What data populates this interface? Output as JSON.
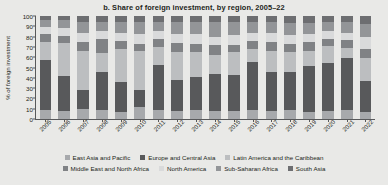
{
  "chart_data": {
    "type": "bar",
    "stacked": true,
    "stacked_mode": "percent",
    "title": "b. Share of foreign investment, by region, 2005–22",
    "xlabel": "",
    "ylabel": "% of foreign investment",
    "ylim": [
      0,
      100
    ],
    "ytick_step": 10,
    "yticks": [
      0,
      10,
      20,
      30,
      40,
      50,
      60,
      70,
      80,
      90,
      100
    ],
    "grid": false,
    "legend_position": "bottom",
    "categories": [
      "2005",
      "2006",
      "2007",
      "2008",
      "2009",
      "2010",
      "2011",
      "2012",
      "2013",
      "2014",
      "2015",
      "2016",
      "2017",
      "2018",
      "2019",
      "2020",
      "2021",
      "2022"
    ],
    "series": [
      {
        "name": "East Asia and Pacific",
        "color": "#a7a9ac",
        "values": [
          9,
          8,
          10,
          9,
          7,
          12,
          9,
          8,
          9,
          8,
          8,
          9,
          8,
          9,
          7,
          8,
          9,
          7
        ]
      },
      {
        "name": "Europe and Central Asia",
        "color": "#58595b",
        "values": [
          48,
          34,
          18,
          37,
          29,
          16,
          43,
          30,
          32,
          36,
          35,
          46,
          38,
          37,
          44,
          46,
          50,
          30
        ]
      },
      {
        "name": "Latin America and the Caribbean",
        "color": "#bcbec0",
        "values": [
          18,
          32,
          38,
          18,
          32,
          38,
          18,
          27,
          24,
          18,
          22,
          13,
          20,
          19,
          15,
          17,
          10,
          22
        ]
      },
      {
        "name": "Middle East and North Africa",
        "color": "#808285",
        "values": [
          8,
          7,
          9,
          14,
          8,
          7,
          8,
          9,
          8,
          10,
          7,
          8,
          9,
          8,
          9,
          7,
          8,
          9
        ]
      },
      {
        "name": "North America",
        "color": "#d9dadb",
        "values": [
          6,
          7,
          9,
          7,
          8,
          10,
          7,
          9,
          10,
          8,
          10,
          8,
          9,
          9,
          8,
          7,
          7,
          12
        ]
      },
      {
        "name": "Sub-Saharan Africa",
        "color": "#939598",
        "values": [
          7,
          8,
          10,
          9,
          10,
          11,
          9,
          11,
          11,
          14,
          12,
          10,
          10,
          11,
          10,
          9,
          10,
          12
        ]
      },
      {
        "name": "South Asia",
        "color": "#6d6e71",
        "values": [
          4,
          4,
          6,
          6,
          6,
          6,
          6,
          6,
          6,
          6,
          6,
          6,
          6,
          7,
          7,
          6,
          6,
          8
        ]
      }
    ]
  },
  "legend": {
    "row1": [
      {
        "label": "East Asia and Pacific",
        "color": "#a7a9ac"
      },
      {
        "label": "Europe and Central Asia",
        "color": "#58595b"
      },
      {
        "label": "Latin America and the Caribbean",
        "color": "#bcbec0"
      }
    ],
    "row2": [
      {
        "label": "Middle East and North Africa",
        "color": "#808285"
      },
      {
        "label": "North America",
        "color": "#d9dadb"
      },
      {
        "label": "Sub-Saharan Africa",
        "color": "#939598"
      },
      {
        "label": "South Asia",
        "color": "#6d6e71"
      }
    ]
  },
  "colors": {
    "background": "#e9e9e7",
    "axis": "#58595b",
    "text": "#231f20"
  }
}
